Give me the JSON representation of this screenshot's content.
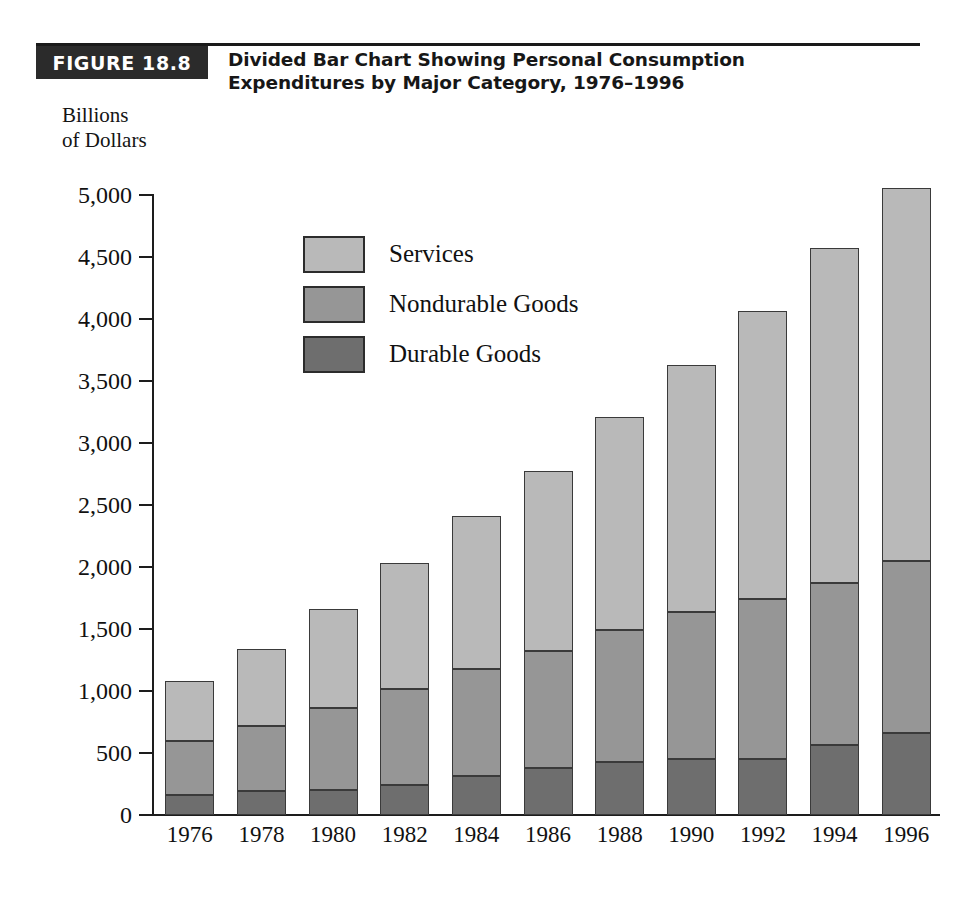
{
  "figure": {
    "badge_label": "FIGURE 18.8",
    "title": "Divided Bar Chart Showing Personal Consumption Expenditures by Major Category, 1976–1996",
    "title_line1": "Divided Bar Chart Showing Personal Consumption",
    "title_line2": "Expenditures by Major Category, 1976–1996",
    "axis_caption_line1": "Billions",
    "axis_caption_line2": "of Dollars"
  },
  "colors": {
    "services": "#b9b9b9",
    "nondurable_goods": "#969696",
    "durable_goods": "#6e6e6e",
    "outline": "#3a3a3a",
    "badge_background": "#2b2b2b",
    "badge_text": "#ffffff"
  },
  "legend": {
    "position": "inside-upper-left",
    "entries": [
      {
        "label": "Services",
        "color": "#b9b9b9"
      },
      {
        "label": "Nondurable Goods",
        "color": "#969696"
      },
      {
        "label": "Durable Goods",
        "color": "#6e6e6e"
      }
    ]
  },
  "axes": {
    "y_title": "Billions of Dollars",
    "y_ticks": [
      "5,000",
      "4,500",
      "4,000",
      "3,500",
      "3,000",
      "2,500",
      "2,000",
      "1,500",
      "1,000",
      "500",
      "0"
    ],
    "y_tick_values": [
      5000,
      4500,
      4000,
      3500,
      3000,
      2500,
      2000,
      1500,
      1000,
      500,
      0
    ],
    "x_title": "",
    "grid": false
  },
  "chart_data": {
    "type": "bar",
    "subtype": "stacked-bar",
    "title": "Divided Bar Chart Showing Personal Consumption Expenditures by Major Category, 1976–1996",
    "subtitle": "",
    "xlabel": "",
    "ylabel": "Billions of Dollars",
    "ylim": [
      0,
      5000
    ],
    "ytick_step": 500,
    "grid": false,
    "legend_position": "inside-upper-left",
    "categories": [
      "1976",
      "1978",
      "1980",
      "1982",
      "1984",
      "1986",
      "1988",
      "1990",
      "1992",
      "1994",
      "1996"
    ],
    "stack_order_bottom_to_top": [
      "Durable Goods",
      "Nondurable Goods",
      "Services"
    ],
    "series": [
      {
        "name": "Durable Goods",
        "color": "#6e6e6e",
        "values": [
          160,
          195,
          205,
          240,
          315,
          380,
          425,
          450,
          450,
          565,
          665
        ]
      },
      {
        "name": "Nondurable Goods",
        "color": "#969696",
        "values": [
          440,
          520,
          660,
          775,
          865,
          940,
          1070,
          1190,
          1290,
          1305,
          1385
        ]
      },
      {
        "name": "Services",
        "color": "#b9b9b9",
        "values": [
          480,
          625,
          800,
          1020,
          1230,
          1455,
          1715,
          1990,
          2325,
          2700,
          3005
        ]
      }
    ],
    "totals": [
      1080,
      1340,
      1665,
      2035,
      2410,
      2775,
      3210,
      3630,
      4065,
      4570,
      5055
    ]
  }
}
